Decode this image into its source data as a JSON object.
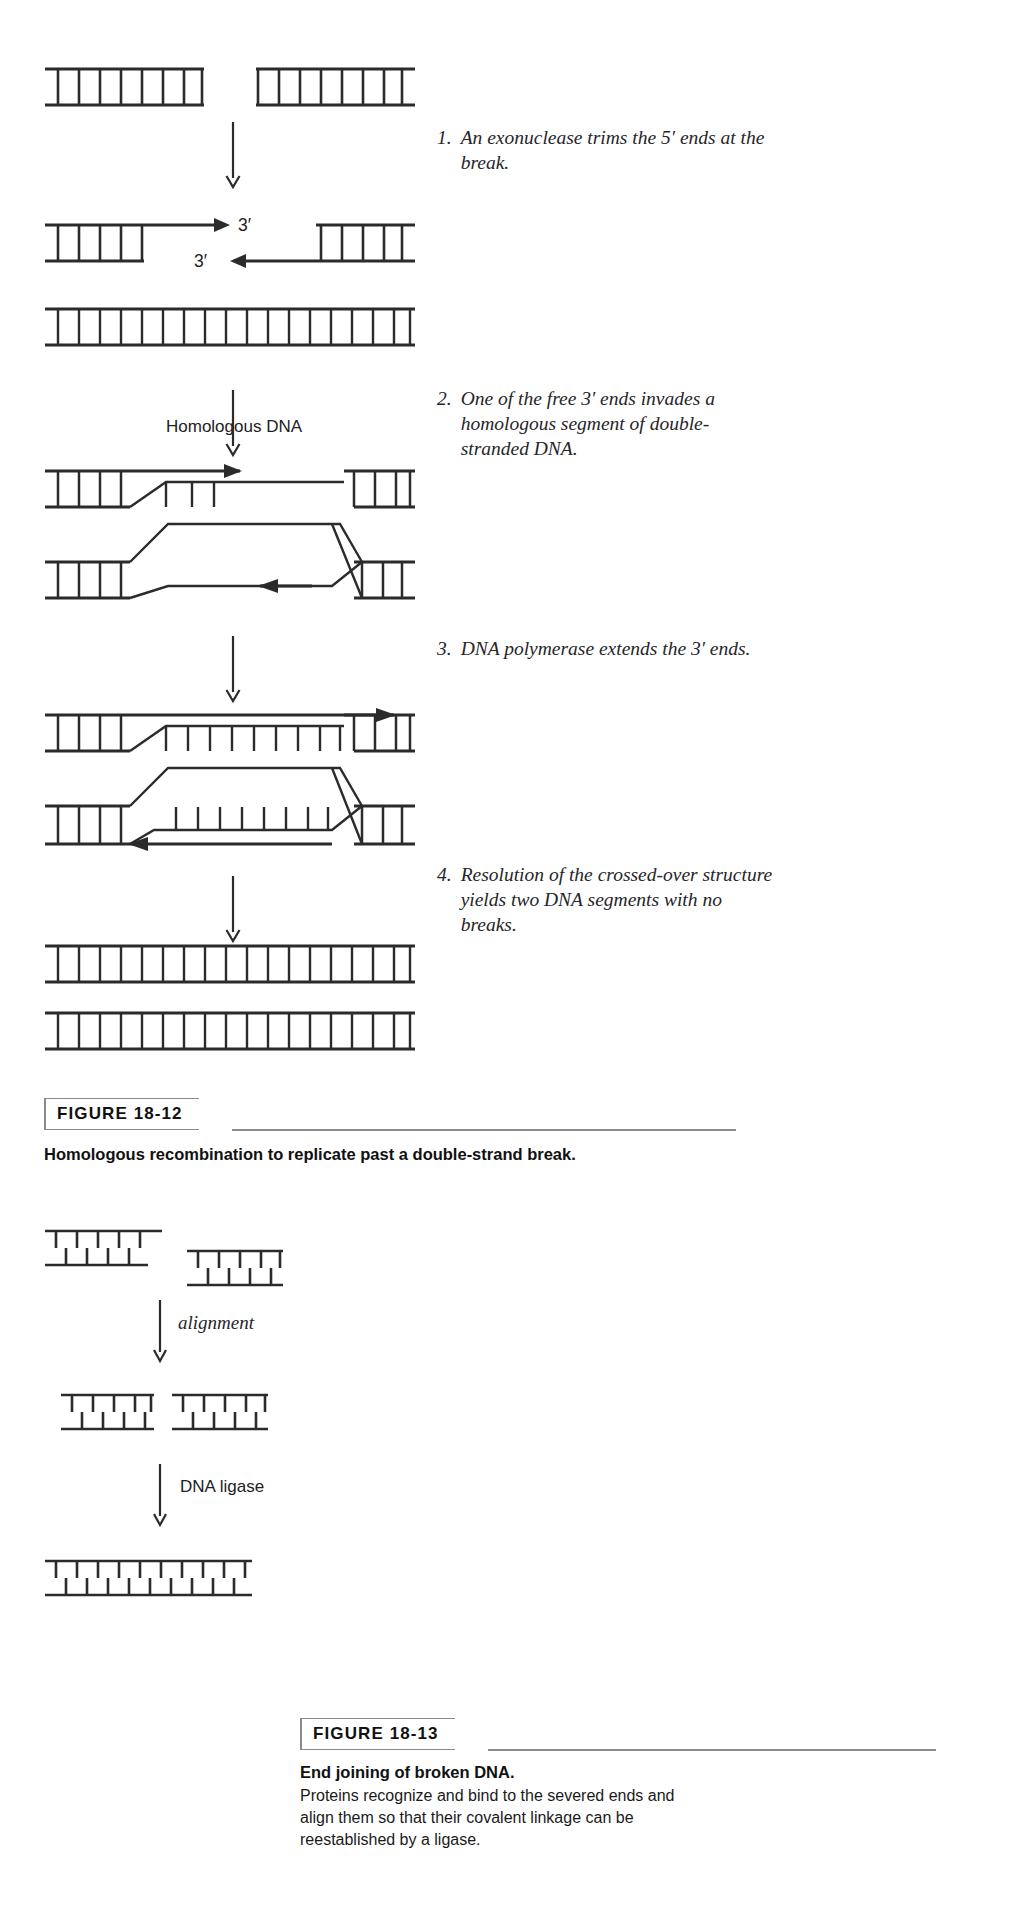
{
  "page": {
    "background": "#ffffff",
    "ink": "#1a1a1a",
    "rule_color": "#8a8a8a"
  },
  "figure_18_12": {
    "label": "FIGURE 18-12",
    "title": "Homologous recombination to replicate past a double-strand break.",
    "diagram_labels": {
      "three_prime_top": "3′",
      "three_prime_bottom": "3′",
      "homologous_dna": "Homologous DNA"
    },
    "steps": [
      {
        "number": "1.",
        "text": "An exonuclease trims the 5′ ends at the break."
      },
      {
        "number": "2.",
        "text": "One of the free 3′ ends invades a homologous segment of double-stranded DNA."
      },
      {
        "number": "3.",
        "text": "DNA polymerase extends the 3′ ends."
      },
      {
        "number": "4.",
        "text": "Resolution of the crossed-over structure yields two DNA segments with no breaks."
      }
    ]
  },
  "figure_18_13": {
    "label": "FIGURE 18-13",
    "title": "End joining of broken DNA.",
    "body": "Proteins recognize and bind to the severed ends and align them so that their covalent linkage can be reestablished by a ligase.",
    "diagram_labels": {
      "alignment": "alignment",
      "dna_ligase": "DNA ligase"
    }
  }
}
